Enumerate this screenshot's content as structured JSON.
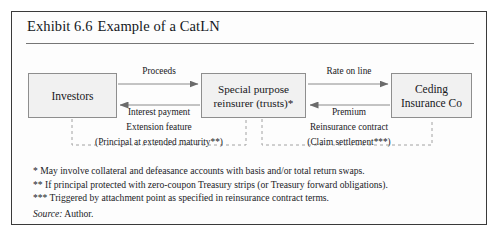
{
  "exhibit": {
    "number": "Exhibit 6.6",
    "title": "Example of a CatLN"
  },
  "diagram": {
    "nodes": [
      {
        "id": "investors",
        "label": "Investors"
      },
      {
        "id": "special_purpose_reinsurer",
        "label": "Special purpose\nreinsurer (trusts)*"
      },
      {
        "id": "ceding_insurance_co",
        "label": "Ceding\nInsurance Co"
      }
    ],
    "flows": {
      "proceeds": "Proceeds",
      "interest_payment": "Interest payment",
      "extension_feature": "Extension feature",
      "principal_extended": "(Principal at extended maturity**)",
      "rate_on_line": "Rate on line",
      "premium": "Premium",
      "reinsurance_contract": "Reinsurance contract",
      "claim_settlement": "(Claim settlement***)"
    }
  },
  "notes": [
    "* May involve collateral and defeasance accounts with basis and/or total return swaps.",
    "** If principal protected with zero-coupon Treasury strips (or Treasury forward obligations).",
    "*** Triggered by attachment point as specified in reinsurance contract terms."
  ],
  "source": {
    "lead": "Source:",
    "value": " Author."
  },
  "colors": {
    "frame": "#3a3a3a",
    "box_fill": "#f1f1f1",
    "box_border": "#8e8e8e",
    "arrow": "#5d5d5d",
    "dashed": "#9a9a9a",
    "text": "#1b1b1f"
  }
}
